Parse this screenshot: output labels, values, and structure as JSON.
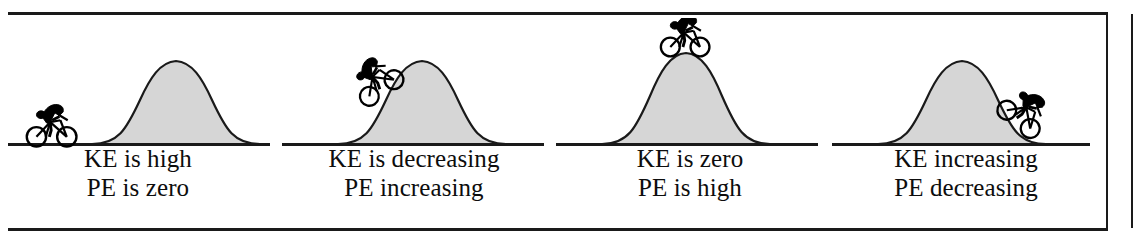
{
  "figure": {
    "background_color": "#ffffff",
    "line_color": "#1a1a1a",
    "hill_fill_color": "#d6d6d6",
    "hill_outline_color": "#1a1a1a",
    "cyclist_color": "#000000",
    "panel_count": 4
  },
  "panels": [
    {
      "id": "panel-1",
      "position_label": "flat-ground-left",
      "cyclist": {
        "name": "cyclist-on-flat-ground",
        "location": "flat ground left of the hill",
        "direction": "right",
        "tilt_degrees": 0
      },
      "hill": {
        "name": "hill-bell-curve",
        "shape": "bell-curve"
      },
      "caption": {
        "line1": "KE is high",
        "line2": "PE is zero"
      }
    },
    {
      "id": "panel-2",
      "position_label": "climbing-left-slope",
      "cyclist": {
        "name": "cyclist-climbing-hill",
        "location": "lower left slope of the hill",
        "direction": "right",
        "tilt_degrees": -34
      },
      "hill": {
        "name": "hill-bell-curve",
        "shape": "bell-curve"
      },
      "caption": {
        "line1": "KE is decreasing",
        "line2": "PE increasing"
      }
    },
    {
      "id": "panel-3",
      "position_label": "at-hill-summit",
      "cyclist": {
        "name": "cyclist-at-summit",
        "location": "top of the hill",
        "direction": "right",
        "tilt_degrees": 0
      },
      "hill": {
        "name": "hill-bell-curve",
        "shape": "bell-curve"
      },
      "caption": {
        "line1": "KE is zero",
        "line2": "PE is high"
      }
    },
    {
      "id": "panel-4",
      "position_label": "descending-right-slope",
      "cyclist": {
        "name": "cyclist-descending-hill",
        "location": "lower right slope of the hill",
        "direction": "right",
        "tilt_degrees": 38
      },
      "hill": {
        "name": "hill-bell-curve",
        "shape": "bell-curve"
      },
      "caption": {
        "line1": "KE increasing",
        "line2": "PE decreasing"
      }
    }
  ]
}
